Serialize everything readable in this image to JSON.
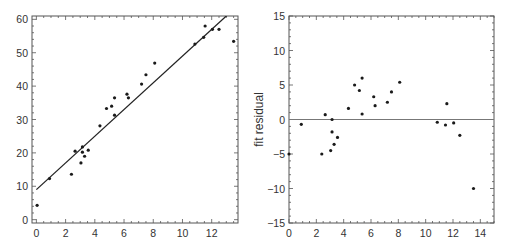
{
  "chart_data": [
    {
      "type": "scatter",
      "title": "",
      "xlabel": "",
      "ylabel": "",
      "xlim": [
        -0.3,
        13.8
      ],
      "ylim": [
        -1,
        61
      ],
      "xticks": [
        0,
        2,
        4,
        6,
        8,
        10,
        12
      ],
      "yticks": [
        0,
        10,
        20,
        30,
        40,
        50,
        60
      ],
      "grid": false,
      "legend": null,
      "fit_line": {
        "intercept": 9.0,
        "slope": 4.0
      },
      "x": [
        0.05,
        0.9,
        2.4,
        2.65,
        3.05,
        3.15,
        3.15,
        3.3,
        3.55,
        4.35,
        4.8,
        5.15,
        5.35,
        5.35,
        6.2,
        6.3,
        7.2,
        7.5,
        8.1,
        10.85,
        11.45,
        11.55,
        12.05,
        12.5,
        13.5
      ],
      "y": [
        4.3,
        12.3,
        13.6,
        20.5,
        17.0,
        20.2,
        21.8,
        19.0,
        20.8,
        28.1,
        33.3,
        34.0,
        36.5,
        31.3,
        37.6,
        36.5,
        40.6,
        43.4,
        46.9,
        52.6,
        54.6,
        58.0,
        57.0,
        57.0,
        53.4
      ]
    },
    {
      "type": "scatter",
      "title": "",
      "xlabel": "",
      "ylabel": "fit residual",
      "xlim": [
        0,
        15
      ],
      "ylim": [
        -15,
        15
      ],
      "xticks": [
        0,
        2,
        4,
        6,
        8,
        10,
        12,
        14
      ],
      "yticks": [
        -15,
        -10,
        -5,
        0,
        5,
        10,
        15
      ],
      "ytick_labels": [
        "−15",
        "−10",
        "−5",
        "0",
        "5",
        "10",
        "15"
      ],
      "grid": false,
      "legend": null,
      "zero_line": 0,
      "x": [
        0.0,
        0.9,
        2.4,
        2.65,
        3.05,
        3.15,
        3.15,
        3.3,
        3.55,
        4.35,
        4.8,
        5.15,
        5.35,
        5.35,
        6.2,
        6.3,
        7.2,
        7.5,
        8.1,
        10.85,
        11.45,
        11.55,
        12.05,
        12.5,
        13.5
      ],
      "y": [
        -5.0,
        -0.7,
        -5.0,
        0.7,
        -4.5,
        0.0,
        -1.8,
        -3.6,
        -2.6,
        1.6,
        5.0,
        4.2,
        6.0,
        0.8,
        3.3,
        2.0,
        2.5,
        4.0,
        5.4,
        -0.4,
        -0.8,
        2.3,
        -0.5,
        -2.3,
        -10.0
      ]
    }
  ],
  "styles": {
    "frame_color": "#555555",
    "point_color": "#1a1a1a",
    "fit_line_color": "#222222",
    "zero_line_color": "#777777"
  }
}
